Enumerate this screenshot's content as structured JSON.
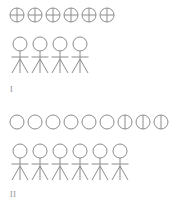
{
  "figure": {
    "canvas": {
      "width": 187,
      "height": 209,
      "background": "#ffffff"
    },
    "stroke_color": "#8c8c8c",
    "stroke_width": 1,
    "groups": [
      {
        "id": "group-I",
        "label": "I",
        "label_x": 10,
        "label_y": 86,
        "tokens": {
          "row_name": "crossed-circle-row",
          "count": 6,
          "start_x": 17,
          "y": 15,
          "spacing": 18,
          "radius": 7,
          "marks": [
            "cross",
            "cross",
            "cross",
            "cross",
            "cross",
            "cross"
          ]
        },
        "people": {
          "row_name": "stick-figure-row",
          "count": 4,
          "start_x": 20,
          "y": 44,
          "spacing": 20,
          "head_radius": 7,
          "body_length": 22,
          "arm_span": 17,
          "leg_spread": 8,
          "leg_length": 14
        }
      },
      {
        "id": "group-II",
        "label": "II",
        "label_x": 10,
        "label_y": 191,
        "tokens": {
          "row_name": "circle-row",
          "count": 9,
          "start_x": 17,
          "y": 122,
          "spacing": 18,
          "radius": 7,
          "marks": [
            "plain",
            "plain",
            "plain",
            "plain",
            "plain",
            "plain",
            "half",
            "half",
            "half"
          ]
        },
        "people": {
          "row_name": "stick-figure-row",
          "count": 6,
          "start_x": 20,
          "y": 151,
          "spacing": 20,
          "head_radius": 7,
          "body_length": 22,
          "arm_span": 17,
          "leg_spread": 8,
          "leg_length": 14
        }
      }
    ]
  }
}
